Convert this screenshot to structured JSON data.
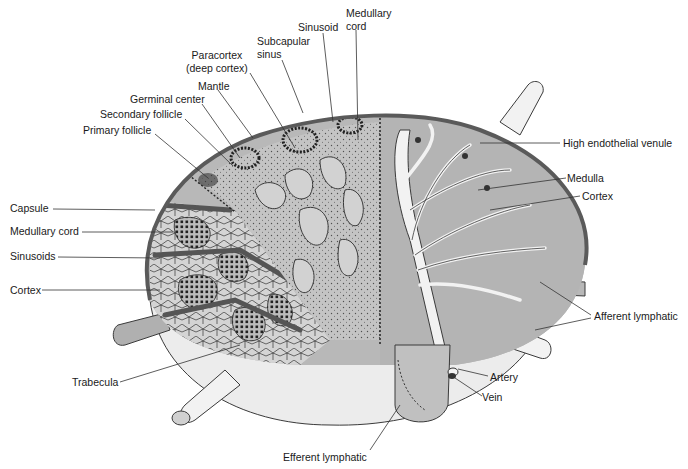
{
  "figure": {
    "colors": {
      "tissue": "#b8b8b8",
      "tissue_light": "#d6d6d6",
      "outline": "#3a3a3a",
      "capsule": "#6a6a6a",
      "vessel_fill": "#f2f2f2",
      "background_bulb": "#ececec",
      "dots": "#222222"
    }
  },
  "labels": {
    "top": {
      "medullary_cord_1": "Medullary",
      "medullary_cord_2": "cord",
      "sinusoid": "Sinusoid",
      "subcapsular_sinus_1": "Subcapular",
      "subcapsular_sinus_2": "sinus",
      "paracortex_1": "Paracortex",
      "paracortex_2": "(deep cortex)",
      "mantle": "Mantle",
      "germinal_center": "Germinal center",
      "secondary_follicle": "Secondary follicle",
      "primary_follicle": "Primary follicle"
    },
    "left": {
      "capsule": "Capsule",
      "medullary_cord": "Medullary cord",
      "sinusoids": "Sinusoids",
      "cortex": "Cortex",
      "trabecula": "Trabecula"
    },
    "right": {
      "high_endothelial_venule": "High endothelial venule",
      "medulla": "Medulla",
      "cortex": "Cortex",
      "afferent_lymphatic": "Afferent lymphatic",
      "artery": "Artery",
      "vein": "Vein"
    },
    "bottom": {
      "efferent_lymphatic": "Efferent lymphatic"
    }
  }
}
